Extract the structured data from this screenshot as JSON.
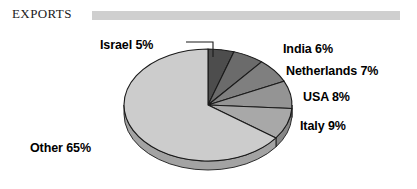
{
  "header": {
    "title": "EXPORTS",
    "rule_color": "#cfcfcf"
  },
  "chart_data": {
    "type": "pie",
    "title": "EXPORTS",
    "unit": "percent",
    "start_angle_deg": 0,
    "direction": "clockwise",
    "three_d": true,
    "categories": [
      "Israel",
      "India",
      "Netherlands",
      "USA",
      "Italy",
      "Other"
    ],
    "values": [
      5,
      6,
      7,
      8,
      9,
      65
    ],
    "labels": [
      "Israel 5%",
      "India 6%",
      "Netherlands 7%",
      "USA 8%",
      "Italy 9%",
      "Other 65%"
    ],
    "colors": [
      "#4d4d4d",
      "#6b6b6b",
      "#7f7f7f",
      "#949494",
      "#a8a8a8",
      "#cccccc"
    ],
    "slice_edge_color": "#1a1a1a",
    "legend": "none",
    "grid": false,
    "leader_lines": [
      "Israel"
    ]
  },
  "slices": [
    {
      "name": "Israel",
      "label": "Israel 5%",
      "value": 5,
      "color": "#4d4d4d"
    },
    {
      "name": "India",
      "label": "India 6%",
      "value": 6,
      "color": "#6b6b6b"
    },
    {
      "name": "Netherlands",
      "label": "Netherlands 7%",
      "value": 7,
      "color": "#7f7f7f"
    },
    {
      "name": "USA",
      "label": "USA 8%",
      "value": 8,
      "color": "#949494"
    },
    {
      "name": "Italy",
      "label": "Italy 9%",
      "value": 9,
      "color": "#a8a8a8"
    },
    {
      "name": "Other",
      "label": "Other 65%",
      "value": 65,
      "color": "#cccccc"
    }
  ]
}
